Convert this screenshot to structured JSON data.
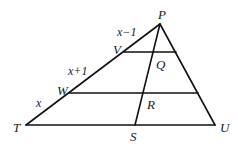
{
  "diagram": {
    "type": "geometry-triangle",
    "points": {
      "P": {
        "label": "P",
        "x": 160,
        "y": 24
      },
      "T": {
        "label": "T",
        "x": 26,
        "y": 125
      },
      "U": {
        "label": "U",
        "x": 215,
        "y": 125
      },
      "S": {
        "label": "S",
        "x": 135,
        "y": 125
      },
      "V": {
        "label": "V",
        "x": 124,
        "y": 52
      },
      "W": {
        "label": "W",
        "x": 69,
        "y": 93
      },
      "Q": {
        "label": "Q"
      },
      "R": {
        "label": "R"
      }
    },
    "segment_labels": {
      "PV": "x−1",
      "VW": "x+1",
      "WT": "x"
    }
  }
}
